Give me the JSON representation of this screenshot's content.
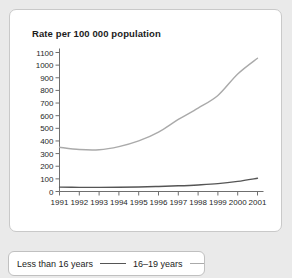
{
  "chart_data": {
    "type": "line",
    "title": "Rate per 100 000 population",
    "xlabel": "",
    "ylabel": "Rate per 100 000 population",
    "x": [
      1991,
      1992,
      1993,
      1994,
      1995,
      1996,
      1997,
      1998,
      1999,
      2000,
      2001
    ],
    "xticklabels": [
      "1991",
      "1992",
      "1993",
      "1994",
      "1995",
      "1996",
      "1997",
      "1998",
      "1999",
      "2000",
      "2001"
    ],
    "yticks": [
      0,
      100,
      200,
      300,
      400,
      500,
      600,
      700,
      800,
      900,
      1000,
      1100
    ],
    "yticklabels": [
      "0",
      "100",
      "200",
      "300",
      "400",
      "500",
      "600",
      "700",
      "800",
      "900",
      "1000",
      "1100"
    ],
    "ylim": [
      0,
      1100
    ],
    "xlim": [
      1991,
      2001
    ],
    "grid": false,
    "legend_position": "below",
    "series": [
      {
        "name": "Less than 16 years",
        "color": "#555555",
        "values": [
          35,
          33,
          33,
          34,
          36,
          40,
          45,
          52,
          62,
          80,
          105
        ]
      },
      {
        "name": "16–19 years",
        "color": "#aaaaaa",
        "values": [
          350,
          332,
          330,
          355,
          400,
          470,
          570,
          660,
          760,
          930,
          1055
        ]
      }
    ]
  },
  "legend": {
    "entries": [
      {
        "label": "Less than 16 years"
      },
      {
        "label": "16–19 years"
      }
    ]
  },
  "colors": {
    "page_background": "#eaeaea",
    "card_background": "#ffffff",
    "axis": "#6f6f6f",
    "text": "#1c1c1c",
    "series_under16": "#555555",
    "series_16to19": "#aaaaaa"
  }
}
